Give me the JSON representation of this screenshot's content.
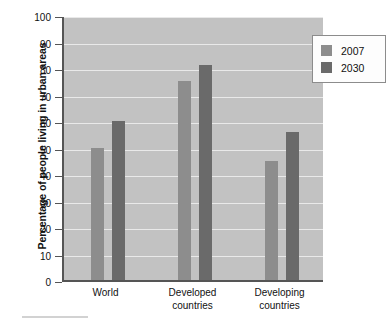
{
  "chart_data": {
    "type": "bar",
    "title": "",
    "xlabel": "",
    "ylabel": "Percentage of people living in urban areas",
    "ylim": [
      0,
      100
    ],
    "ytick_step": 10,
    "yticks": [
      "100",
      "90",
      "80",
      "70",
      "60",
      "50",
      "40",
      "30",
      "20",
      "10",
      "0"
    ],
    "grid": true,
    "legend_position": "top-right",
    "categories": [
      "World",
      "Developed countries",
      "Developing countries"
    ],
    "category_lines": [
      [
        "World"
      ],
      [
        "Developed",
        "countries"
      ],
      [
        "Developing",
        "countries"
      ]
    ],
    "series": [
      {
        "name": "2007",
        "color": "#8d8d8d",
        "values": [
          50,
          75,
          45
        ]
      },
      {
        "name": "2030",
        "color": "#6a6a6a",
        "values": [
          60,
          81,
          56
        ]
      }
    ],
    "colors": {
      "plot_background": "#c2c2c2",
      "gridline": "#e9e9e9",
      "axis": "#555555",
      "legend_background": "#fdfdfd",
      "legend_border": "#8c8c8c",
      "text": "#111111"
    }
  }
}
